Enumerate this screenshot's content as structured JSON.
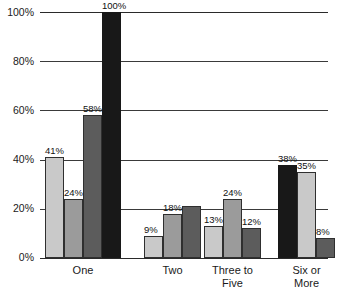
{
  "chart_data": {
    "type": "bar",
    "title": "",
    "subtitle": "",
    "xlabel": "",
    "ylabel": "",
    "ylim": [
      0,
      100
    ],
    "yticks": [
      "0%",
      "20%",
      "40%",
      "60%",
      "80%",
      "100%"
    ],
    "ytick_values": [
      0,
      20,
      40,
      60,
      80,
      100
    ],
    "grid": true,
    "legend": "none",
    "categories": [
      "One",
      "Two",
      "Three to\nFive",
      "Six or\nMore"
    ],
    "series": [
      {
        "name": "Series 1",
        "color": "#c9c9c9",
        "values": [
          41,
          9,
          13,
          38
        ]
      },
      {
        "name": "Series 2",
        "color": "#9b9b9b",
        "values": [
          24,
          18,
          24,
          35
        ]
      },
      {
        "name": "Series 3",
        "color": "#5c5c5c",
        "values": [
          58,
          21,
          12,
          8
        ]
      },
      {
        "name": "Series 4",
        "color": "#181818",
        "values": [
          100,
          null,
          null,
          null
        ]
      }
    ],
    "groups": [
      {
        "category": "One",
        "bars": [
          {
            "value": 41,
            "label": "41%",
            "shade": 0
          },
          {
            "value": 24,
            "label": "24%",
            "shade": 1
          },
          {
            "value": 58,
            "label": "58%",
            "shade": 2
          },
          {
            "value": 100,
            "label": "100%",
            "shade": 3
          }
        ]
      },
      {
        "category": "Two",
        "bars": [
          {
            "value": 9,
            "label": "9%",
            "shade": 0
          },
          {
            "value": 18,
            "label": "18%",
            "shade": 1
          },
          {
            "value": 21,
            "label": "",
            "shade": 2
          }
        ]
      },
      {
        "category": "Three to Five",
        "bars": [
          {
            "value": 13,
            "label": "13%",
            "shade": 0
          },
          {
            "value": 24,
            "label": "24%",
            "shade": 1
          },
          {
            "value": 12,
            "label": "12%",
            "shade": 2
          }
        ]
      },
      {
        "category": "Six or More",
        "bars": [
          {
            "value": 38,
            "label": "38%",
            "shade": 3
          },
          {
            "value": 35,
            "label": "35%",
            "shade": 0
          },
          {
            "value": 8,
            "label": "8%",
            "shade": 2
          }
        ]
      }
    ]
  },
  "axis": {
    "y_labels": [
      "100%",
      "80%",
      "60%",
      "40%",
      "20%",
      "0%"
    ]
  },
  "categories_display": [
    "One",
    "Two",
    "Three to\nFive",
    "Six or\nMore"
  ]
}
